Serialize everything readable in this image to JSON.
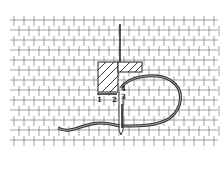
{
  "diagram": {
    "type": "needlework-stitch-illustration",
    "grid": {
      "x0": 14,
      "y0": 20,
      "cols": 20,
      "rows": 13,
      "cell": 10,
      "color": "#555555"
    },
    "colors": {
      "background": "#ffffff",
      "line": "#333333",
      "thread": "#444444",
      "thread_highlight": "#bbbbbb"
    },
    "labels": [
      {
        "id": "1",
        "text": "1",
        "x": 97,
        "y": 96
      },
      {
        "id": "2",
        "text": "2",
        "x": 112,
        "y": 96
      },
      {
        "id": "3",
        "text": "3",
        "x": 121,
        "y": 93
      },
      {
        "id": "4",
        "text": "4",
        "x": 121,
        "y": 85
      }
    ]
  }
}
